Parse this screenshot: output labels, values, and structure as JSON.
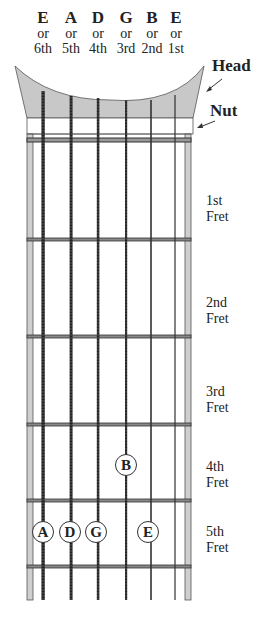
{
  "strings": [
    {
      "name": "E",
      "or": "or",
      "number": "6th",
      "x": 43,
      "width": 3.2,
      "wound": true
    },
    {
      "name": "A",
      "or": "or",
      "number": "5th",
      "x": 71,
      "width": 2.8,
      "wound": true
    },
    {
      "name": "D",
      "or": "or",
      "number": "4th",
      "x": 98,
      "width": 2.4,
      "wound": true
    },
    {
      "name": "G",
      "or": "or",
      "number": "3rd",
      "x": 126,
      "width": 1.9,
      "wound": true
    },
    {
      "name": "B",
      "or": "or",
      "number": "2nd",
      "x": 151,
      "width": 1.5,
      "wound": false
    },
    {
      "name": "E",
      "or": "or",
      "number": "1st",
      "x": 175,
      "width": 1.1,
      "wound": false
    }
  ],
  "callouts": {
    "head": "Head",
    "nut": "Nut"
  },
  "frets": [
    {
      "label_line1": "1st",
      "label_line2": "Fret",
      "y": 239
    },
    {
      "label_line1": "2nd",
      "label_line2": "Fret",
      "y": 336
    },
    {
      "label_line1": "3rd",
      "label_line2": "Fret",
      "y": 424
    },
    {
      "label_line1": "4th",
      "label_line2": "Fret",
      "y": 500
    },
    {
      "label_line1": "5th",
      "label_line2": "Fret",
      "y": 566
    }
  ],
  "notes": [
    {
      "label": "B",
      "string": "3rd",
      "fret": 4,
      "x": 126,
      "y": 465
    },
    {
      "label": "A",
      "string": "6th",
      "fret": 5,
      "x": 43,
      "y": 532
    },
    {
      "label": "D",
      "string": "5th",
      "fret": 5,
      "x": 70,
      "y": 532
    },
    {
      "label": "G",
      "string": "4th",
      "fret": 5,
      "x": 96,
      "y": 532
    },
    {
      "label": "E",
      "string": "2nd",
      "fret": 5,
      "x": 148,
      "y": 532
    }
  ],
  "colors": {
    "headstock_fill": "#c8c8c8",
    "edge_strip": "#cfcfcf",
    "line": "#333333"
  }
}
